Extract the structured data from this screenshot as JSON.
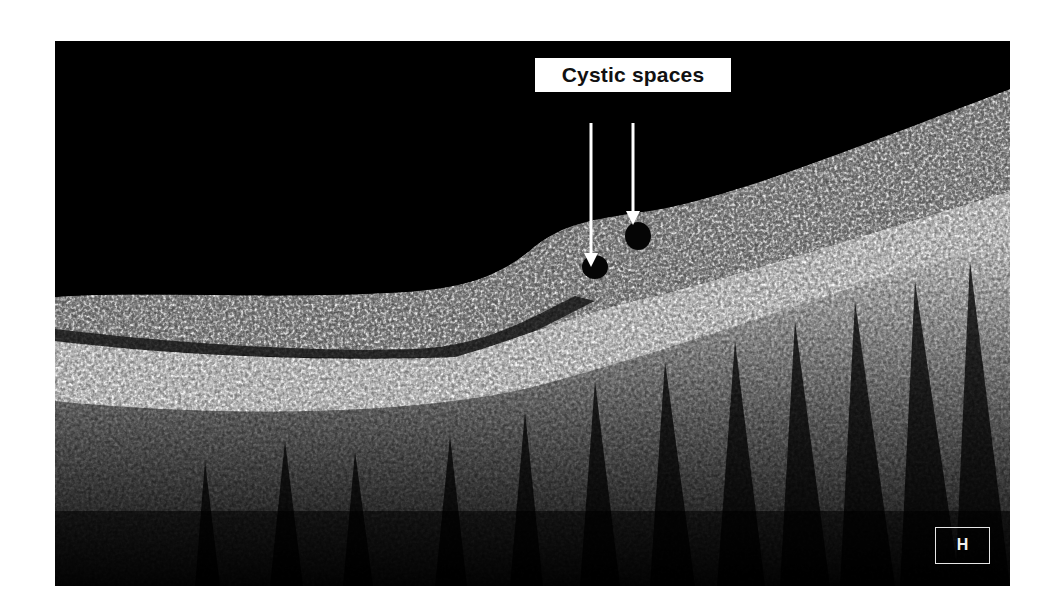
{
  "figure": {
    "type": "OCT retinal cross-section scan",
    "background_color": "#000000",
    "page_background": "#ffffff",
    "annotation": {
      "label": "Cystic spaces",
      "arrow_count": 2,
      "arrow_color": "#ffffff"
    },
    "panel_label": "H"
  }
}
